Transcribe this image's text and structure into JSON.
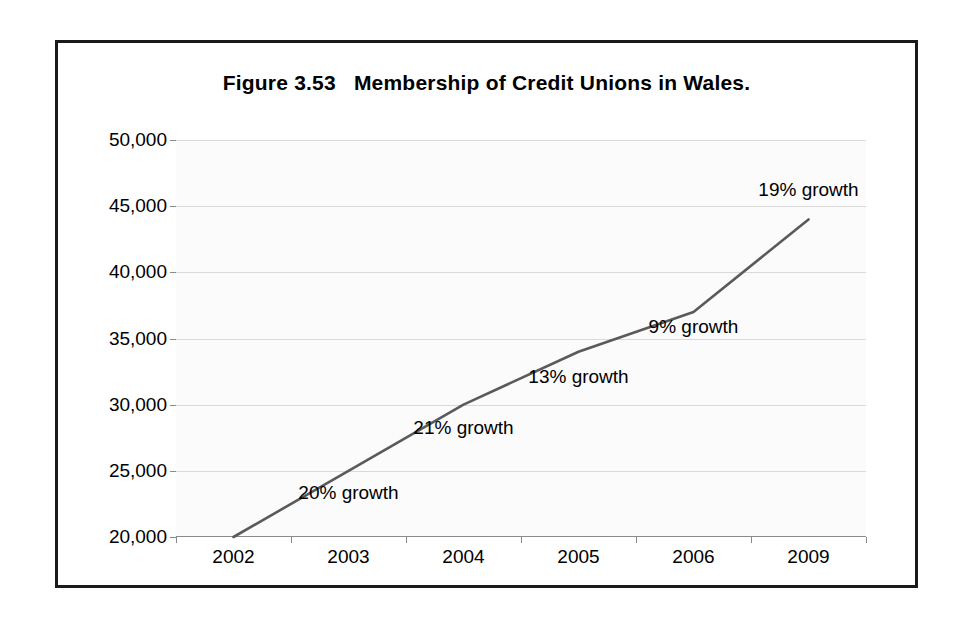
{
  "figure": {
    "title": "Figure 3.53   Membership of Credit Unions in Wales.",
    "frame_color": "#1a1a1a",
    "background": "#ffffff"
  },
  "chart_data": {
    "type": "line",
    "title": "Figure 3.53   Membership of Credit Unions in Wales.",
    "xlabel": "",
    "ylabel": "",
    "categories": [
      "2002",
      "2003",
      "2004",
      "2005",
      "2006",
      "2009"
    ],
    "values": [
      20000,
      25000,
      30000,
      34000,
      37000,
      44000
    ],
    "ylim": [
      20000,
      50000
    ],
    "ytick_step": 5000,
    "ytick_labels": [
      "50,000",
      "45,000",
      "40,000",
      "35,000",
      "30,000",
      "25,000",
      "20,000"
    ],
    "ytick_values": [
      50000,
      45000,
      40000,
      35000,
      30000,
      25000,
      20000
    ],
    "grid": true,
    "legend": "none",
    "line_color": "#5a5a5a",
    "line_width": 2.6,
    "plot_background": "#fbfbfb",
    "gridline_color": "#d9d9d9",
    "annotations": [
      {
        "text": "20% growth",
        "x_category": "2003",
        "value": 23300,
        "name": "growth-2002-2004"
      },
      {
        "text": "21% growth",
        "x_category": "2004",
        "value": 28200,
        "name": "growth-2004"
      },
      {
        "text": "13% growth",
        "x_category": "2005",
        "value": 32100,
        "name": "growth-2005"
      },
      {
        "text": "9% growth",
        "x_category": "2006",
        "value": 35900,
        "name": "growth-2006"
      },
      {
        "text": "19% growth",
        "x_category": "2009",
        "value": 46200,
        "name": "growth-2009"
      }
    ]
  }
}
